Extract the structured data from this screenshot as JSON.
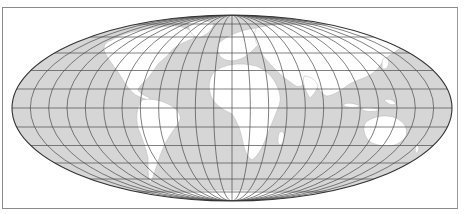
{
  "map": {
    "projection": "mollweide",
    "graticule_step_deg": 15,
    "colors": {
      "ocean": "#d6d6d6",
      "land": "#ffffff",
      "graticule": "#4a4a4a",
      "outline": "#333333",
      "frame": "#8a8a8a",
      "background": "#ffffff"
    },
    "geometry": {
      "cx": 232,
      "cy": 108,
      "rx": 220,
      "ry": 93
    }
  }
}
